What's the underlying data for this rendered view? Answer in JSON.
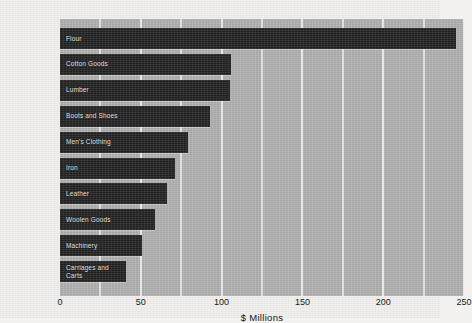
{
  "chart_data": {
    "type": "bar",
    "orientation": "horizontal",
    "title": "",
    "xlabel": "$ Millions",
    "ylabel": "",
    "xlim": [
      0,
      250
    ],
    "xticks": [
      "0",
      "50",
      "100",
      "150",
      "200",
      "250"
    ],
    "xtick_values": [
      0,
      50,
      100,
      150,
      200,
      250
    ],
    "gridlines": [
      25,
      50,
      75,
      100,
      125,
      150,
      175,
      200,
      225,
      250
    ],
    "grid": true,
    "legend": "none",
    "categories": [
      "Flour",
      "Cotton Goods",
      "Lumber",
      "Boots and Shoes",
      "Men's Clothing",
      "Iron",
      "Leather",
      "Woolen Goods",
      "Machinery",
      "Carriages and Carts"
    ],
    "values": [
      245,
      106,
      105,
      93,
      79,
      71,
      66,
      59,
      51,
      41
    ],
    "colors": {
      "bar": "#282828",
      "plot_background": "#b2b2b2",
      "gridline": "#ececec",
      "page_background": "#f1f0ee",
      "bar_label_text": "#e6e6e6",
      "axis_text": "#202020"
    }
  }
}
